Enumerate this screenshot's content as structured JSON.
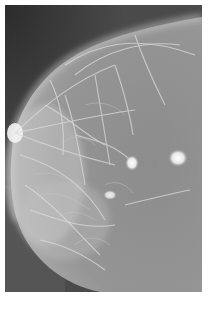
{
  "image": {
    "subject": "Mammogram (X-ray of breast tissue)",
    "colors": {
      "background": "#ffffff",
      "outside_tissue": "#3c3c3c",
      "tissue_base": "#8a8a8a",
      "fibrous_strands": "#d8d8d8",
      "bright_lesion": "#f2f2f2"
    },
    "features": [
      {
        "name": "dense-glandular-tissue",
        "location": "left and lower-left area"
      },
      {
        "name": "round-bright-mass",
        "location": "right-center"
      },
      {
        "name": "bright-nodule",
        "location": "center"
      },
      {
        "name": "spiculated-density",
        "location": "lower-center"
      }
    ]
  }
}
